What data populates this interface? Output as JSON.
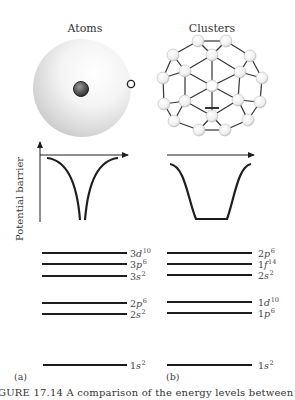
{
  "figure": {
    "panels": [
      {
        "id": "a",
        "title": "Atoms",
        "tag": "(a)",
        "illustration": "atom-sphere-with-nucleus-and-electron",
        "potential": "coulomb-well",
        "levels": [
          {
            "n": "3",
            "l": "d",
            "occ": "10"
          },
          {
            "n": "3",
            "l": "p",
            "occ": "6"
          },
          {
            "n": "3",
            "l": "s",
            "occ": "2"
          },
          {
            "n": "2",
            "l": "p",
            "occ": "6"
          },
          {
            "n": "2",
            "l": "s",
            "occ": "2"
          },
          {
            "n": "1",
            "l": "s",
            "occ": "2"
          }
        ]
      },
      {
        "id": "b",
        "title": "Clusters",
        "tag": "(b)",
        "illustration": "atomic-cluster-ball",
        "potential": "flat-bottom-well",
        "levels": [
          {
            "n": "2",
            "l": "p",
            "occ": "6"
          },
          {
            "n": "1",
            "l": "f",
            "occ": "14"
          },
          {
            "n": "2",
            "l": "s",
            "occ": "2"
          },
          {
            "n": "1",
            "l": "d",
            "occ": "10"
          },
          {
            "n": "1",
            "l": "p",
            "occ": "6"
          },
          {
            "n": "1",
            "l": "s",
            "occ": "2"
          }
        ]
      }
    ],
    "y_axis_label": "Potential barrier",
    "caption": "GURE 17.14   A comparison of the energy levels between (a) t"
  },
  "colors": {
    "line": "#1e1e1e",
    "sphere": "#d9d9d9",
    "nucleus": "#4a4a4a"
  }
}
